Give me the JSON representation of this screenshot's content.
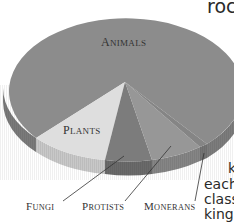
{
  "chart_data": {
    "type": "pie",
    "style": "3d",
    "title": "",
    "slices": [
      {
        "label": "Animals",
        "value": 75,
        "color": "#8c8c8c"
      },
      {
        "label": "Plants",
        "value": 13,
        "color": "#dcdcdc"
      },
      {
        "label": "Fungi",
        "value": 6,
        "color": "#7a7a7a"
      },
      {
        "label": "Protists",
        "value": 5,
        "color": "#969696"
      },
      {
        "label": "Monerans",
        "value": 1,
        "color": "#858585"
      }
    ],
    "labels": {
      "animals": "Animals",
      "plants": "Plants",
      "fungi": "Fungi",
      "protists": "Protists",
      "monerans": "Monerans"
    },
    "legend": "none",
    "grid": false
  },
  "side_text": {
    "top": "rock",
    "line1": "k",
    "line2": "each",
    "line3": "class",
    "line4": "king"
  }
}
